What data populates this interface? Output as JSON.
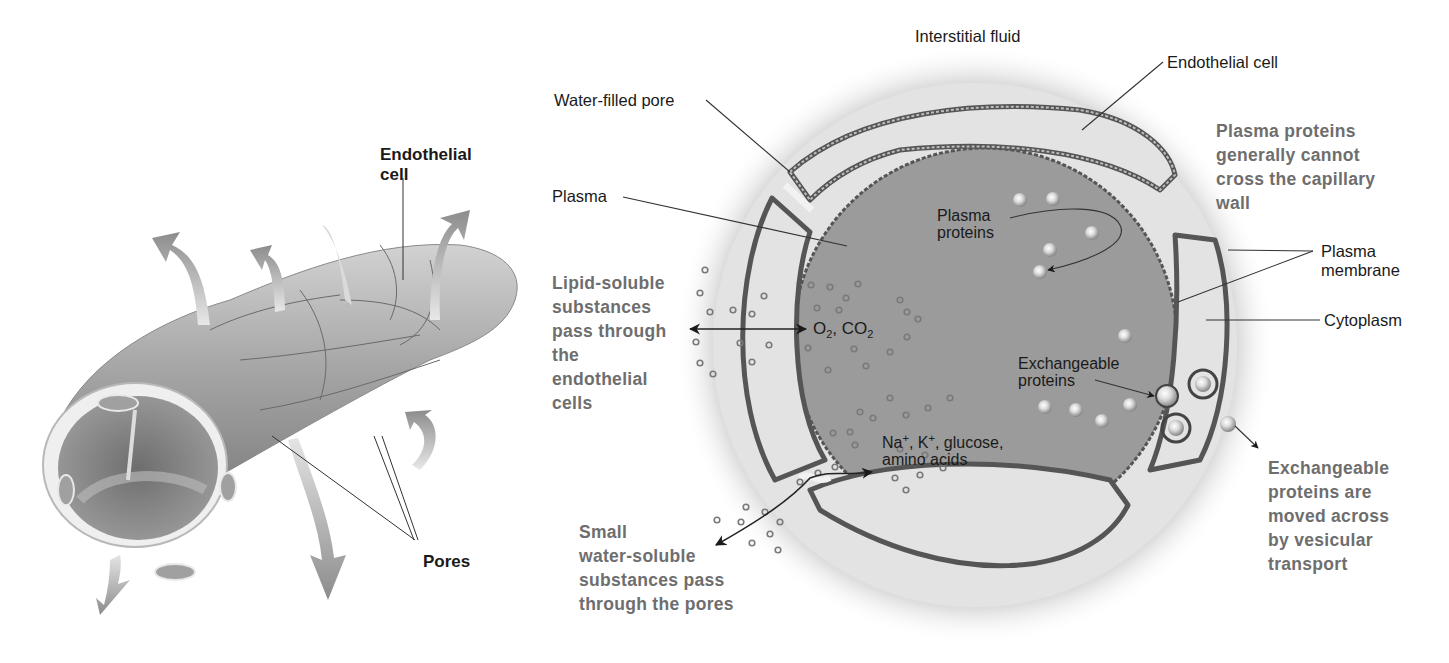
{
  "figure": {
    "panels": [
      {
        "id": "left",
        "subject": "capillary tube (3D view)"
      },
      {
        "id": "right",
        "subject": "capillary cross-section"
      }
    ]
  },
  "left_panel": {
    "endothelial_cell_label": [
      "Endothelial",
      "cell"
    ],
    "pores_label": "Pores"
  },
  "right_panel": {
    "interstitial_fluid": "Interstitial fluid",
    "endothelial_cell": "Endothelial cell",
    "water_filled_pore": "Water-filled pore",
    "plasma": "Plasma",
    "plasma_proteins": [
      "Plasma",
      "proteins"
    ],
    "plasma_membrane": [
      "Plasma",
      "membrane"
    ],
    "cytoplasm": "Cytoplasm",
    "exchangeable_proteins": [
      "Exchangeable",
      "proteins"
    ],
    "gases": {
      "o2": "O",
      "o2_sub": "2",
      "sep": ", ",
      "co2": "CO",
      "co2_sub": "2"
    },
    "ions": {
      "na": "Na",
      "na_sup": "+",
      "sep1": ", ",
      "k": "K",
      "k_sup": "+",
      "rest": ", glucose,",
      "line2": "amino acids"
    },
    "notes": {
      "plasma_proteins_note": [
        "Plasma proteins",
        "generally cannot",
        "cross the capillary",
        "wall"
      ],
      "lipid_note": [
        "Lipid-soluble",
        "substances",
        "pass through",
        "the",
        "endothelial",
        "cells"
      ],
      "small_water_note": [
        "Small",
        "water-soluble",
        "substances pass",
        "through the pores"
      ],
      "vesicular_note": [
        "Exchangeable",
        "proteins are",
        "moved across",
        "by vesicular",
        "transport"
      ]
    }
  },
  "colors": {
    "plasma_fill": "#9a9a9a",
    "cytoplasm_fill": "#e3e3e3",
    "membrane": "#555555",
    "note_text": "#6e6e6e",
    "label_text": "#1a1a1a",
    "halo": "#cfcfcf"
  }
}
